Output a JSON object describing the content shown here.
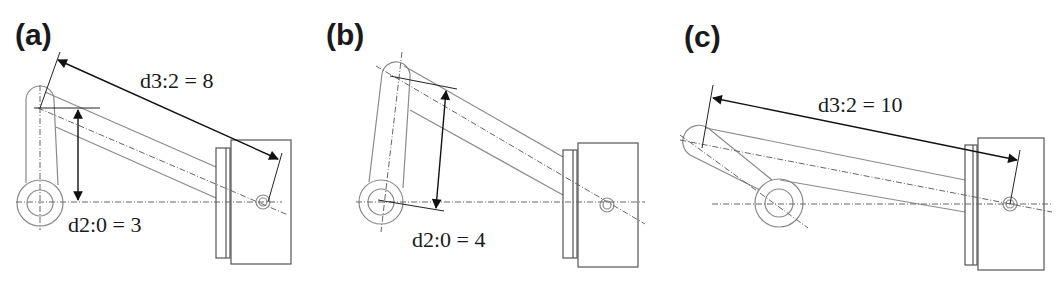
{
  "figure": {
    "panels": [
      {
        "id": "a",
        "label": "(a)",
        "dimensions": [
          {
            "name": "d3:2",
            "value": 8,
            "text": "d3:2 = 8"
          },
          {
            "name": "d2:0",
            "value": 3,
            "text": "d2:0 = 3"
          }
        ]
      },
      {
        "id": "b",
        "label": "(b)",
        "dimensions": [
          {
            "name": "d2:0",
            "value": 4,
            "text": "d2:0 = 4"
          }
        ]
      },
      {
        "id": "c",
        "label": "(c)",
        "dimensions": [
          {
            "name": "d3:2",
            "value": 10,
            "text": "d3:2 = 10"
          }
        ]
      }
    ]
  }
}
